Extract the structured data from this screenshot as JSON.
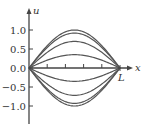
{
  "chart_data": {
    "type": "line",
    "title": "",
    "xlabel": "x",
    "ylabel": "u",
    "x_end_label": "L",
    "ylim": [
      -1.4,
      1.4
    ],
    "xlim": [
      0,
      1
    ],
    "y_ticks": [
      1.0,
      0.5,
      0.0,
      -0.5,
      -1.0
    ],
    "y_tick_labels": [
      "1.0",
      "0.5",
      "0.0",
      "−0.5",
      "−1.0"
    ],
    "x_minor_ticks": [
      0.2,
      0.4,
      0.6,
      0.8
    ],
    "grid": false,
    "legend": "none",
    "series": [
      {
        "name": "curve-1",
        "amplitude": 1.0
      },
      {
        "name": "curve-2",
        "amplitude": 0.92
      },
      {
        "name": "curve-3",
        "amplitude": 0.7
      },
      {
        "name": "curve-4",
        "amplitude": 0.35
      },
      {
        "name": "curve-5",
        "amplitude": -0.35
      },
      {
        "name": "curve-6",
        "amplitude": -0.72
      },
      {
        "name": "curve-7",
        "amplitude": -0.93
      },
      {
        "name": "curve-8",
        "amplitude": -1.0
      }
    ],
    "line_color": "#555555"
  }
}
